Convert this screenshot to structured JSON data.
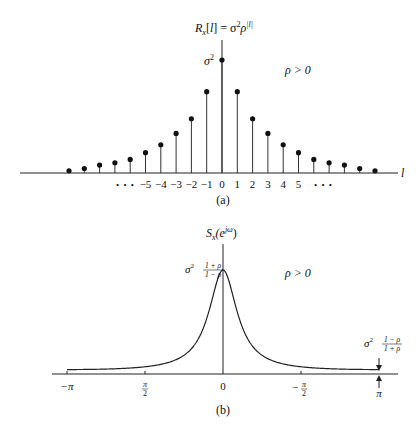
{
  "chart_data": [
    {
      "id": "a",
      "type": "stem",
      "title": "R_x[l] = σ²ρ^|l|",
      "title_parts": {
        "main": "R",
        "sub": "x",
        "rest": "[l] = σ",
        "sup1": "2",
        "rho": "ρ",
        "sup2": "|l|"
      },
      "xlabel": "l",
      "ylabel": "",
      "caption": "(a)",
      "annotation_peak": "σ",
      "annotation_peak_sup": "2",
      "annotation_param": "ρ > 0",
      "rho_estimate": 0.71,
      "x": [
        -10,
        -9,
        -8,
        -7,
        -6,
        -5,
        -4,
        -3,
        -2,
        -1,
        0,
        1,
        2,
        3,
        4,
        5,
        6,
        7,
        8,
        9,
        10
      ],
      "values": [
        0.02,
        0.04,
        0.07,
        0.09,
        0.12,
        0.18,
        0.25,
        0.35,
        0.48,
        0.72,
        1.0,
        0.72,
        0.48,
        0.35,
        0.25,
        0.18,
        0.12,
        0.09,
        0.07,
        0.04,
        0.02
      ],
      "tick_labels": [
        {
          "x": -5,
          "label": "−5"
        },
        {
          "x": -4,
          "label": "−4"
        },
        {
          "x": -3,
          "label": "−3"
        },
        {
          "x": -2,
          "label": "−2"
        },
        {
          "x": -1,
          "label": "−1"
        },
        {
          "x": 0,
          "label": "0"
        },
        {
          "x": 1,
          "label": "1"
        },
        {
          "x": 2,
          "label": "2"
        },
        {
          "x": 3,
          "label": "3"
        },
        {
          "x": 4,
          "label": "4"
        },
        {
          "x": 5,
          "label": "5"
        }
      ],
      "ellipsis": "• • •",
      "ylim": [
        0,
        1.1
      ],
      "grid": false
    },
    {
      "id": "b",
      "type": "line",
      "title": "S_x(e^{jω})",
      "title_parts": {
        "main": "S",
        "sub": "x",
        "rest": "(e",
        "sup": "jω",
        "close": ")"
      },
      "xlabel": "",
      "ylabel": "",
      "caption": "(b)",
      "annotation_param": "ρ > 0",
      "annotation_peak": {
        "prefix": "σ",
        "sup": "2",
        "num": "1 + ρ",
        "den": "1 − ρ"
      },
      "annotation_min": {
        "prefix": "σ",
        "sup": "2",
        "num": "1 − ρ",
        "den": "1 + ρ"
      },
      "formula": "σ²(1−ρ²)/(1−2ρcosω+ρ²)",
      "rho_estimate": 0.71,
      "xlim": [
        -3.14159,
        3.14159
      ],
      "ticks": [
        {
          "x": -3.14159,
          "label": "−π",
          "kind": "plain"
        },
        {
          "x": -1.5708,
          "label_num": "π",
          "label_den": "2",
          "sign": "",
          "kind": "frac"
        },
        {
          "x": 0,
          "label": "0",
          "kind": "plain"
        },
        {
          "x": 1.5708,
          "label_num": "π",
          "label_den": "2",
          "sign": "−",
          "kind": "frac"
        },
        {
          "x": 3.14159,
          "label": "π",
          "kind": "plain"
        }
      ],
      "sample_points": {
        "x": [
          -3.14,
          -2.36,
          -1.57,
          -0.79,
          -0.39,
          0,
          0.39,
          0.79,
          1.57,
          2.36,
          3.14
        ],
        "y_relative_to_peak": [
          0.029,
          0.035,
          0.06,
          0.17,
          0.45,
          1.0,
          0.45,
          0.17,
          0.06,
          0.035,
          0.029
        ]
      },
      "grid": false
    }
  ]
}
